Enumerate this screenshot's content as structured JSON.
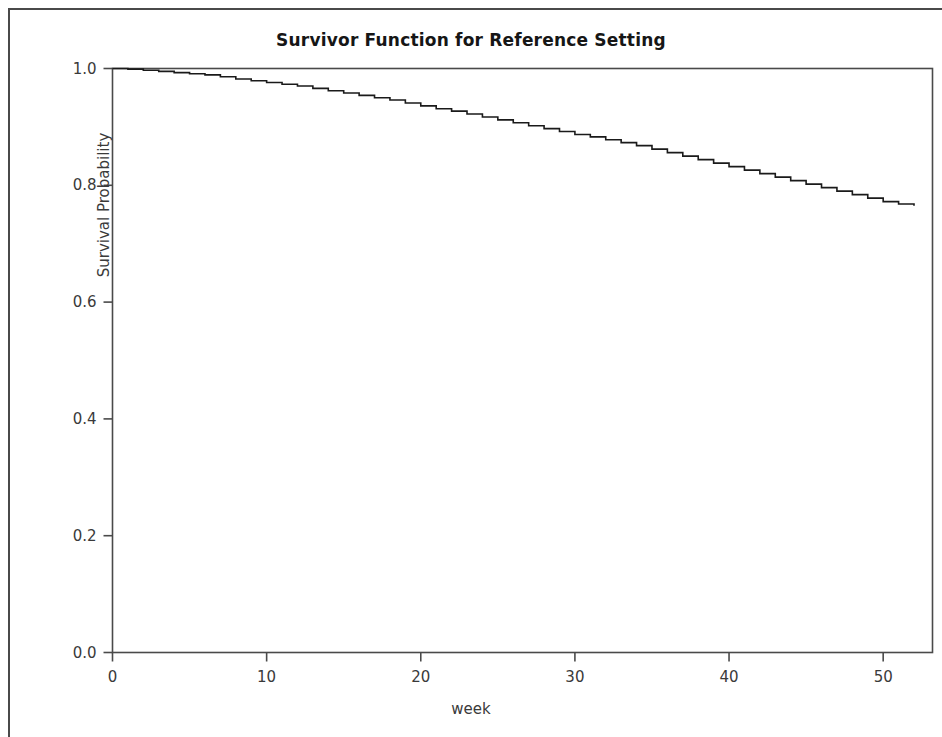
{
  "chart_data": {
    "type": "line",
    "subtype": "step-survivor-function",
    "title": "Survivor Function for Reference Setting",
    "xlabel": "week",
    "ylabel": "Survival Probability",
    "xlim": [
      0,
      52
    ],
    "ylim": [
      0.0,
      1.0
    ],
    "xticks": [
      0,
      10,
      20,
      30,
      40,
      50
    ],
    "xtick_labels": [
      "0",
      "10",
      "20",
      "30",
      "40",
      "50"
    ],
    "yticks": [
      0.0,
      0.2,
      0.4,
      0.6,
      0.8,
      1.0
    ],
    "ytick_labels": [
      "0.0",
      "0.2",
      "0.4",
      "0.6",
      "0.8",
      "1.0"
    ],
    "grid": false,
    "legend": false,
    "line_color": "#1a1a1a",
    "line_width": 1.6,
    "series": [
      {
        "name": "Survivor Function",
        "step": "post",
        "x": [
          0,
          1,
          2,
          3,
          4,
          5,
          6,
          7,
          8,
          9,
          10,
          11,
          12,
          13,
          14,
          15,
          16,
          17,
          18,
          19,
          20,
          21,
          22,
          23,
          24,
          25,
          26,
          27,
          28,
          29,
          30,
          31,
          32,
          33,
          34,
          35,
          36,
          37,
          38,
          39,
          40,
          41,
          42,
          43,
          44,
          45,
          46,
          47,
          48,
          49,
          50,
          51,
          52
        ],
        "y": [
          1.0,
          0.999,
          0.997,
          0.995,
          0.993,
          0.991,
          0.989,
          0.986,
          0.982,
          0.979,
          0.976,
          0.973,
          0.97,
          0.966,
          0.962,
          0.958,
          0.954,
          0.95,
          0.946,
          0.941,
          0.936,
          0.931,
          0.927,
          0.922,
          0.917,
          0.912,
          0.907,
          0.902,
          0.897,
          0.892,
          0.887,
          0.883,
          0.878,
          0.873,
          0.868,
          0.862,
          0.856,
          0.85,
          0.844,
          0.838,
          0.832,
          0.826,
          0.82,
          0.814,
          0.808,
          0.802,
          0.796,
          0.79,
          0.784,
          0.778,
          0.772,
          0.768,
          0.765
        ]
      }
    ]
  },
  "figure": {
    "title": "Survivor Function for Reference Setting",
    "xlabel": "week",
    "ylabel": "Survival Probability"
  }
}
